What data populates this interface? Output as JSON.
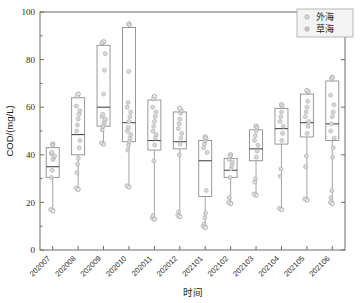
{
  "chart_data": {
    "type": "box",
    "title": "",
    "xlabel": "时间",
    "ylabel": "COD/(mg/L)",
    "ylim": [
      0,
      100
    ],
    "yticks": [
      0,
      20,
      40,
      60,
      80,
      100
    ],
    "grid": false,
    "legend_position": "top-right",
    "legend": [
      {
        "name": "外海",
        "marker": "open-circle",
        "color": "#d9d9d9"
      },
      {
        "name": "草海",
        "marker": "filled-circle",
        "color": "#c9c9c9"
      }
    ],
    "categories": [
      "202007",
      "202008",
      "202009",
      "202010",
      "202011",
      "202012",
      "202101",
      "202102",
      "202103",
      "202104",
      "202105",
      "202106"
    ],
    "boxes": [
      {
        "category": "202007",
        "min": 16.5,
        "q1": 30.5,
        "median": 35.0,
        "q3": 43.0,
        "max": 44.5,
        "points": [
          17.0,
          30.5,
          33.5,
          38.0,
          39.0,
          39.5,
          40.5,
          41.0,
          44.0
        ]
      },
      {
        "category": "202008",
        "min": 25.5,
        "q1": 40.0,
        "median": 48.5,
        "q3": 64.0,
        "max": 65.5,
        "points": [
          26.0,
          32.5,
          36.0,
          38.5,
          43.0,
          46.0,
          50.0,
          52.5,
          55.0,
          57.0,
          58.5,
          60.5,
          64.5
        ]
      },
      {
        "category": "202009",
        "min": 44.5,
        "q1": 52.0,
        "median": 60.0,
        "q3": 86.0,
        "max": 87.5,
        "points": [
          45.0,
          50.5,
          52.0,
          53.0,
          54.0,
          55.0,
          56.0,
          57.0,
          65.5,
          75.5,
          82.5,
          87.0
        ]
      },
      {
        "category": "202010",
        "min": 26.5,
        "q1": 45.5,
        "median": 53.5,
        "q3": 93.5,
        "max": 95.0,
        "points": [
          27.0,
          42.0,
          44.0,
          45.5,
          47.0,
          48.5,
          50.0,
          51.5,
          54.0,
          56.0,
          58.0,
          60.0,
          62.0,
          75.0,
          94.5
        ]
      },
      {
        "category": "202011",
        "min": 13.0,
        "q1": 42.0,
        "median": 46.0,
        "q3": 63.0,
        "max": 64.5,
        "points": [
          13.5,
          14.5,
          37.5,
          44.0,
          47.0,
          48.5,
          50.0,
          52.0,
          54.0,
          56.0,
          58.0,
          60.0,
          63.5
        ]
      },
      {
        "category": "202012",
        "min": 14.0,
        "q1": 42.5,
        "median": 45.5,
        "q3": 58.0,
        "max": 59.5,
        "points": [
          14.5,
          16.0,
          40.0,
          44.5,
          47.0,
          49.0,
          51.0,
          53.0,
          55.0,
          57.5,
          58.5
        ]
      },
      {
        "category": "202101",
        "min": 9.5,
        "q1": 22.5,
        "median": 37.5,
        "q3": 46.0,
        "max": 47.5,
        "points": [
          10.0,
          11.0,
          13.5,
          15.5,
          25.0,
          41.0,
          43.0,
          44.5,
          46.0,
          47.0
        ]
      },
      {
        "category": "202102",
        "min": 19.5,
        "q1": 30.5,
        "median": 33.5,
        "q3": 38.5,
        "max": 40.0,
        "points": [
          20.0,
          22.0,
          30.5,
          34.0,
          35.5,
          37.0,
          38.0,
          39.5
        ]
      },
      {
        "category": "202103",
        "min": 23.0,
        "q1": 37.5,
        "median": 42.5,
        "q3": 50.5,
        "max": 52.0,
        "points": [
          23.5,
          28.5,
          30.0,
          39.0,
          41.5,
          44.0,
          46.0,
          48.0,
          50.0,
          51.5
        ]
      },
      {
        "category": "202104",
        "min": 17.0,
        "q1": 44.5,
        "median": 51.0,
        "q3": 59.5,
        "max": 61.0,
        "points": [
          17.5,
          31.0,
          34.0,
          46.0,
          49.0,
          52.0,
          54.0,
          56.0,
          58.0,
          60.5
        ]
      },
      {
        "category": "202105",
        "min": 21.0,
        "q1": 47.5,
        "median": 53.5,
        "q3": 65.5,
        "max": 67.0,
        "points": [
          21.5,
          35.0,
          39.5,
          49.0,
          52.0,
          54.0,
          56.0,
          58.0,
          60.0,
          62.5,
          66.5
        ]
      },
      {
        "category": "202106",
        "min": 19.5,
        "q1": 46.0,
        "median": 53.0,
        "q3": 71.0,
        "max": 72.5,
        "points": [
          20.0,
          22.0,
          25.0,
          39.0,
          43.0,
          47.0,
          50.0,
          53.0,
          56.0,
          58.0,
          61.0,
          65.0,
          72.0
        ]
      }
    ]
  }
}
